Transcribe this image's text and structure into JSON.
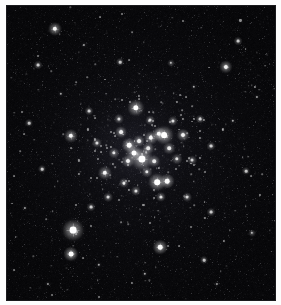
{
  "image": {
    "title": "Open Star Cluster Field",
    "subject": "open-star-cluster",
    "medium": "astronomical-plate",
    "width_px": 281,
    "height_px": 305,
    "background_color": "#050507",
    "star_color": "#ffffff",
    "frame_color": "#fdfdfd",
    "plate_border_color": "#1a1a1d",
    "caption": ""
  },
  "plate": {
    "left_px": 6,
    "top_px": 5,
    "width_px": 270,
    "height_px": 296,
    "nebulosity_note": "faint central glow around cluster core"
  },
  "cluster": {
    "name": "",
    "core_center_x": 142,
    "core_center_y": 155,
    "core_radius_px": 58,
    "member_count_visible": 60
  },
  "stars": [
    {
      "x": 141,
      "y": 158,
      "r": 3.6,
      "b": 1.0,
      "spike": 11
    },
    {
      "x": 72,
      "y": 229,
      "r": 3.4,
      "b": 1.0,
      "spike": 13
    },
    {
      "x": 163,
      "y": 134,
      "r": 2.9,
      "b": 0.96,
      "spike": 9
    },
    {
      "x": 156,
      "y": 181,
      "r": 2.8,
      "b": 0.94,
      "spike": 9
    },
    {
      "x": 135,
      "y": 107,
      "r": 2.7,
      "b": 0.93,
      "spike": 9
    },
    {
      "x": 133,
      "y": 152,
      "r": 2.5,
      "b": 0.9,
      "spike": 8
    },
    {
      "x": 128,
      "y": 144,
      "r": 2.3,
      "b": 0.88,
      "spike": 7
    },
    {
      "x": 158,
      "y": 133,
      "r": 2.2,
      "b": 0.86,
      "spike": 7
    },
    {
      "x": 166,
      "y": 180,
      "r": 2.3,
      "b": 0.87,
      "spike": 7
    },
    {
      "x": 150,
      "y": 137,
      "r": 2.2,
      "b": 0.85,
      "spike": 7
    },
    {
      "x": 70,
      "y": 253,
      "r": 2.4,
      "b": 0.88,
      "spike": 8
    },
    {
      "x": 159,
      "y": 246,
      "r": 2.3,
      "b": 0.86,
      "spike": 7
    },
    {
      "x": 70,
      "y": 135,
      "r": 2.2,
      "b": 0.84,
      "spike": 7
    },
    {
      "x": 104,
      "y": 172,
      "r": 2.2,
      "b": 0.84,
      "spike": 7
    },
    {
      "x": 54,
      "y": 28,
      "r": 2.2,
      "b": 0.84,
      "spike": 7
    },
    {
      "x": 225,
      "y": 66,
      "r": 2.1,
      "b": 0.82,
      "spike": 6
    },
    {
      "x": 182,
      "y": 134,
      "r": 2.0,
      "b": 0.8,
      "spike": 6
    },
    {
      "x": 127,
      "y": 160,
      "r": 2.0,
      "b": 0.8,
      "spike": 6
    },
    {
      "x": 138,
      "y": 140,
      "r": 1.9,
      "b": 0.78,
      "spike": 6
    },
    {
      "x": 120,
      "y": 131,
      "r": 1.9,
      "b": 0.78,
      "spike": 6
    },
    {
      "x": 147,
      "y": 147,
      "r": 1.8,
      "b": 0.76,
      "spike": 0
    },
    {
      "x": 153,
      "y": 160,
      "r": 1.8,
      "b": 0.76,
      "spike": 0
    },
    {
      "x": 168,
      "y": 147,
      "r": 1.8,
      "b": 0.76,
      "spike": 0
    },
    {
      "x": 113,
      "y": 152,
      "r": 1.7,
      "b": 0.74,
      "spike": 0
    },
    {
      "x": 176,
      "y": 158,
      "r": 1.7,
      "b": 0.74,
      "spike": 0
    },
    {
      "x": 146,
      "y": 171,
      "r": 1.7,
      "b": 0.74,
      "spike": 0
    },
    {
      "x": 123,
      "y": 182,
      "r": 1.6,
      "b": 0.72,
      "spike": 0
    },
    {
      "x": 135,
      "y": 190,
      "r": 1.6,
      "b": 0.72,
      "spike": 0
    },
    {
      "x": 160,
      "y": 196,
      "r": 1.6,
      "b": 0.72,
      "spike": 0
    },
    {
      "x": 172,
      "y": 120,
      "r": 1.6,
      "b": 0.72,
      "spike": 0
    },
    {
      "x": 118,
      "y": 118,
      "r": 1.6,
      "b": 0.7,
      "spike": 0
    },
    {
      "x": 96,
      "y": 142,
      "r": 1.6,
      "b": 0.7,
      "spike": 0
    },
    {
      "x": 191,
      "y": 159,
      "r": 1.5,
      "b": 0.68,
      "spike": 0
    },
    {
      "x": 107,
      "y": 196,
      "r": 1.5,
      "b": 0.68,
      "spike": 0
    },
    {
      "x": 186,
      "y": 196,
      "r": 1.5,
      "b": 0.68,
      "spike": 0
    },
    {
      "x": 149,
      "y": 119,
      "r": 1.5,
      "b": 0.68,
      "spike": 0
    },
    {
      "x": 199,
      "y": 118,
      "r": 1.4,
      "b": 0.64,
      "spike": 0
    },
    {
      "x": 88,
      "y": 110,
      "r": 1.4,
      "b": 0.64,
      "spike": 0
    },
    {
      "x": 210,
      "y": 145,
      "r": 1.4,
      "b": 0.64,
      "spike": 0
    },
    {
      "x": 90,
      "y": 206,
      "r": 1.4,
      "b": 0.64,
      "spike": 0
    },
    {
      "x": 210,
      "y": 211,
      "r": 1.4,
      "b": 0.62,
      "spike": 0
    },
    {
      "x": 37,
      "y": 64,
      "r": 1.4,
      "b": 0.62,
      "spike": 0
    },
    {
      "x": 237,
      "y": 40,
      "r": 1.4,
      "b": 0.62,
      "spike": 0
    },
    {
      "x": 41,
      "y": 168,
      "r": 1.3,
      "b": 0.6,
      "spike": 0
    },
    {
      "x": 245,
      "y": 170,
      "r": 1.3,
      "b": 0.6,
      "spike": 0
    },
    {
      "x": 119,
      "y": 61,
      "r": 1.3,
      "b": 0.6,
      "spike": 0
    },
    {
      "x": 203,
      "y": 259,
      "r": 1.3,
      "b": 0.58,
      "spike": 0
    },
    {
      "x": 28,
      "y": 122,
      "r": 1.3,
      "b": 0.58,
      "spike": 0
    },
    {
      "x": 170,
      "y": 62,
      "r": 1.2,
      "b": 0.56,
      "spike": 0
    },
    {
      "x": 251,
      "y": 232,
      "r": 1.2,
      "b": 0.56,
      "spike": 0
    },
    {
      "x": 98,
      "y": 264,
      "r": 1.2,
      "b": 0.54,
      "spike": 0
    },
    {
      "x": 144,
      "y": 273,
      "r": 1.2,
      "b": 0.54,
      "spike": 0
    },
    {
      "x": 232,
      "y": 120,
      "r": 1.2,
      "b": 0.54,
      "spike": 0
    },
    {
      "x": 60,
      "y": 93,
      "r": 1.2,
      "b": 0.52,
      "spike": 0
    },
    {
      "x": 193,
      "y": 86,
      "r": 1.2,
      "b": 0.52,
      "spike": 0
    },
    {
      "x": 24,
      "y": 207,
      "r": 1.1,
      "b": 0.5,
      "spike": 0
    },
    {
      "x": 256,
      "y": 96,
      "r": 1.1,
      "b": 0.5,
      "spike": 0
    },
    {
      "x": 83,
      "y": 44,
      "r": 1.1,
      "b": 0.5,
      "spike": 0
    },
    {
      "x": 216,
      "y": 283,
      "r": 1.1,
      "b": 0.48,
      "spike": 0
    },
    {
      "x": 47,
      "y": 283,
      "r": 1.1,
      "b": 0.48,
      "spike": 0
    }
  ],
  "field_star_params": {
    "count": 620,
    "min_radius": 0.4,
    "max_radius": 1.1,
    "min_brightness": 0.12,
    "max_brightness": 0.55,
    "seed": 20240517
  }
}
